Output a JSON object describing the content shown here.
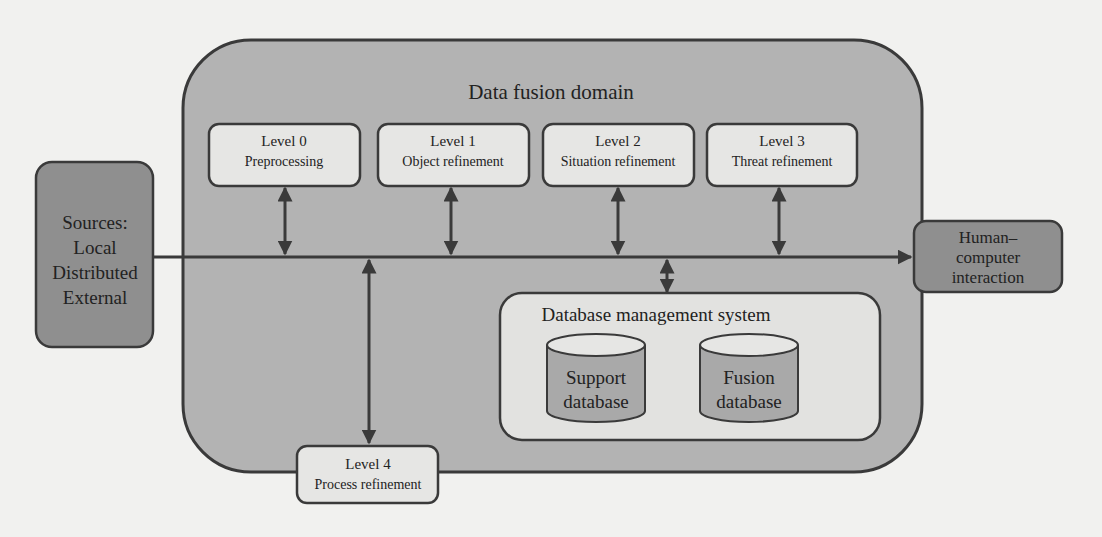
{
  "diagram": {
    "domain_title": "Data fusion domain",
    "sources": {
      "lines": [
        "Sources:",
        "Local",
        "Distributed",
        "External"
      ]
    },
    "hci": {
      "lines": [
        "Human–",
        "computer",
        "interaction"
      ]
    },
    "levels": [
      {
        "title": "Level 0",
        "subtitle": "Preprocessing"
      },
      {
        "title": "Level 1",
        "subtitle": "Object refinement"
      },
      {
        "title": "Level 2",
        "subtitle": "Situation refinement"
      },
      {
        "title": "Level 3",
        "subtitle": "Threat refinement"
      },
      {
        "title": "Level 4",
        "subtitle": "Process refinement"
      }
    ],
    "dbms": {
      "title": "Database management system",
      "databases": [
        {
          "lines": [
            "Support",
            "database"
          ]
        },
        {
          "lines": [
            "Fusion",
            "database"
          ]
        }
      ]
    },
    "colors": {
      "domain_fill": "#b3b3b3",
      "box_fill": "#e6e6e4",
      "dark_box_fill": "#8f8f8f",
      "stroke": "#3a3a3a",
      "page": "#f1f1ef"
    }
  }
}
